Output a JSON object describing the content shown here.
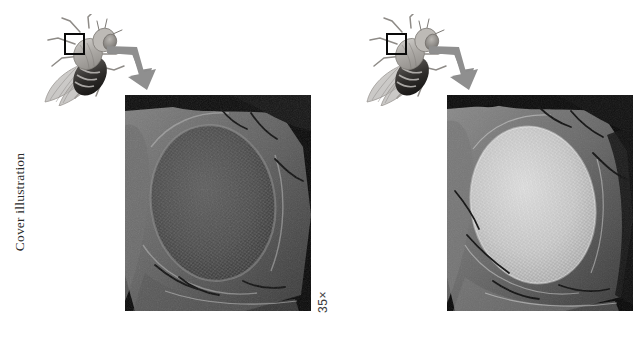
{
  "page": {
    "background_color": "#ffffff",
    "caption": "Cover illustration",
    "caption_color": "#2b2b2b"
  },
  "panels": [
    {
      "id": "left",
      "specimen_label": "fruit-fly-illustration",
      "roi_label": "compound-eye-region",
      "arrow_label": "magnification-arrow",
      "arrow_color": "#8c8c8c",
      "micrograph": {
        "label": "sem-compound-eye-dark",
        "tone": "dark",
        "background_color": "#0a0a0a",
        "eye_color": "#4a4a4a",
        "magnification": "35×"
      }
    },
    {
      "id": "right",
      "specimen_label": "fruit-fly-illustration",
      "roi_label": "compound-eye-region",
      "arrow_label": "magnification-arrow",
      "arrow_color": "#8c8c8c",
      "micrograph": {
        "label": "sem-compound-eye-light",
        "tone": "light",
        "background_color": "#0a0a0a",
        "eye_color": "#c9c9c9",
        "magnification": "35×"
      }
    }
  ]
}
